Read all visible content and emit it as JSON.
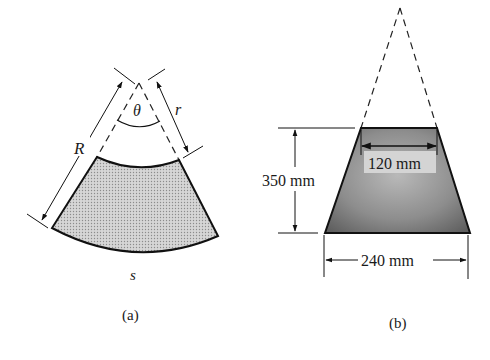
{
  "figure_a": {
    "caption": "(a)",
    "labels": {
      "angle": "θ",
      "outer_radius": "R",
      "inner_radius": "r",
      "arc_length": "s"
    },
    "fill_color": "#c9c9c9"
  },
  "figure_b": {
    "caption": "(b)",
    "dimensions": {
      "height": "350 mm",
      "top_width": "120 mm",
      "bottom_width": "240 mm"
    },
    "fill_color": "#8a8a8a"
  }
}
